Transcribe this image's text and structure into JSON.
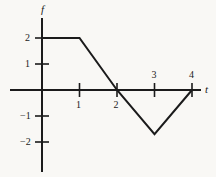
{
  "chart_data": {
    "type": "line",
    "title": "",
    "subtitle": "",
    "xlabel": "t",
    "ylabel": "f",
    "grid": false,
    "legend": "none",
    "xlim": [
      -0.9,
      4.2
    ],
    "ylim": [
      -2.8,
      2.8
    ],
    "xticks": [
      1,
      2,
      3,
      4
    ],
    "xtick_labels": [
      "1",
      "2",
      "3",
      "4"
    ],
    "yticks": [
      2,
      1,
      -1,
      -2
    ],
    "ytick_labels": [
      "2",
      "1",
      "−1",
      "−2"
    ],
    "series": [
      {
        "name": "f(t)",
        "x": [
          0,
          1,
          2,
          3,
          4
        ],
        "values": [
          2,
          2,
          0,
          -1.7,
          0
        ],
        "color": "#1b1b1b"
      }
    ],
    "annotations": []
  },
  "axes": {
    "y_axis_label": "f",
    "x_axis_label": "t"
  },
  "x_tick_labels": [
    {
      "text": "1",
      "value": 1,
      "side": "below"
    },
    {
      "text": "2",
      "value": 2,
      "side": "below"
    },
    {
      "text": "3",
      "value": 3,
      "side": "above"
    },
    {
      "text": "4",
      "value": 4,
      "side": "above"
    }
  ],
  "y_tick_labels": [
    {
      "text": "2",
      "value": 2
    },
    {
      "text": "1",
      "value": 1
    },
    {
      "text": "−1",
      "value": -1
    },
    {
      "text": "−2",
      "value": -2
    }
  ],
  "colors": {
    "background": "#f9f8f5",
    "ink": "#1b1b1b"
  }
}
